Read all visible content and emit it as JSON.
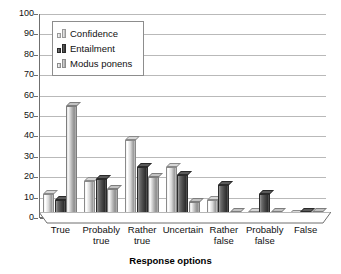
{
  "chart_data": {
    "type": "bar",
    "title": "",
    "subtitle": "",
    "xlabel": "Response options",
    "ylabel": "",
    "ylim": [
      0,
      100
    ],
    "ytick_step": 10,
    "yticks": [
      0,
      10,
      20,
      30,
      40,
      50,
      60,
      70,
      80,
      90,
      100
    ],
    "ytick_labels": [
      "0",
      "10",
      "20",
      "30",
      "40",
      "50",
      "60",
      "70",
      "80",
      "90",
      "100"
    ],
    "grid": true,
    "grid_axis": "y",
    "legend_position": "upper-left-inside",
    "categories": [
      "True",
      "Probably\ntrue",
      "Rather\ntrue",
      "Uncertain",
      "Rather\nfalse",
      "Probably\nfalse",
      "False"
    ],
    "series": [
      {
        "name": "Confidence",
        "color": "#d8d8d8",
        "values": [
          12,
          18,
          38,
          25,
          9,
          3,
          2
        ]
      },
      {
        "name": "Entailment",
        "color": "#3d3d3d",
        "values": [
          9,
          19,
          25,
          21,
          16,
          12,
          3
        ]
      },
      {
        "name": "Modus ponens",
        "color": "#b5b5b5",
        "values": [
          55,
          14,
          20,
          8,
          3,
          3,
          3
        ]
      }
    ],
    "style": {
      "bar_fill": "grayscale-gradient",
      "three_d": true,
      "axis_color": "#6f6f6f",
      "gridline_color": "#b9b9b9",
      "background": "#ffffff"
    }
  },
  "legend": {
    "items": [
      {
        "label": "Confidence"
      },
      {
        "label": "Entailment"
      },
      {
        "label": "Modus ponens"
      }
    ]
  }
}
